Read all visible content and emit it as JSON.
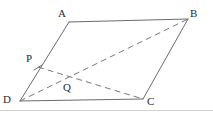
{
  "figure": {
    "type": "geometry-diagram",
    "shape": "parallelogram",
    "stroke_color": "#6b6b72",
    "dash_color": "#7a7a80",
    "label_color": "#2b2b2b",
    "background_color": "#ffffff",
    "baseline_rule_color": "#cfcfcf"
  },
  "labels": {
    "A": "A",
    "B": "B",
    "C": "C",
    "D": "D",
    "P": "P",
    "Q": "Q"
  },
  "points": {
    "A": {
      "x": 69,
      "y": 22
    },
    "B": {
      "x": 188,
      "y": 19
    },
    "C": {
      "x": 143,
      "y": 99
    },
    "D": {
      "x": 20,
      "y": 101
    },
    "P": {
      "x": 38,
      "y": 67
    },
    "Q": {
      "x": 67,
      "y": 77
    }
  },
  "label_positions": {
    "A": {
      "x": 58,
      "y": 8
    },
    "B": {
      "x": 190,
      "y": 8
    },
    "C": {
      "x": 147,
      "y": 96
    },
    "D": {
      "x": 3,
      "y": 94
    },
    "P": {
      "x": 26,
      "y": 53
    },
    "Q": {
      "x": 63,
      "y": 82
    }
  },
  "segments": [
    {
      "name": "side-AB",
      "from": "A",
      "to": "B",
      "style": "solid"
    },
    {
      "name": "side-BC",
      "from": "B",
      "to": "C",
      "style": "solid"
    },
    {
      "name": "side-CD",
      "from": "C",
      "to": "D",
      "style": "solid"
    },
    {
      "name": "side-DA",
      "from": "D",
      "to": "A",
      "style": "solid"
    },
    {
      "name": "diagonal-DB",
      "from": "D",
      "to": "B",
      "style": "dashed"
    },
    {
      "name": "segment-PC",
      "from": "P",
      "to": "C",
      "style": "dashed"
    }
  ]
}
